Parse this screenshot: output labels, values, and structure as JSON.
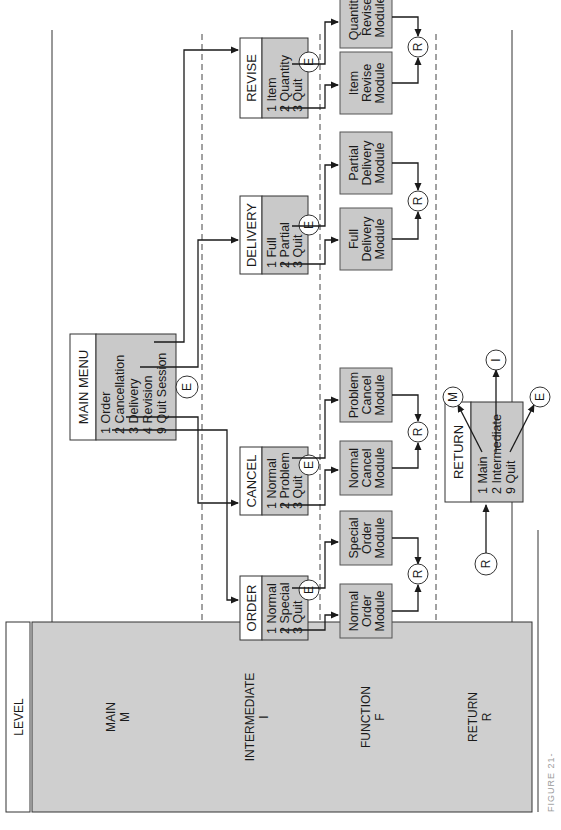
{
  "figure": {
    "caption_partial": "FIGURE 21-",
    "orientation": "rotated 90° counter-clockwise",
    "colors": {
      "box_fill": "#c9c9c9",
      "level_fill": "#cfcfcf",
      "line": "#1a1a1a",
      "dashed": "#444444",
      "background": "#ffffff"
    }
  },
  "levels": {
    "header": "LEVEL",
    "rows": [
      {
        "name": "MAIN",
        "code": "M"
      },
      {
        "name": "INTERMEDIATE",
        "code": "I"
      },
      {
        "name": "FUNCTION",
        "code": "F"
      },
      {
        "name": "RETURN",
        "code": "R"
      }
    ]
  },
  "main_menu": {
    "title": "MAIN MENU",
    "items": [
      "1 Order",
      "2 Cancellation",
      "3 Delivery",
      "4 Revision",
      "9 Quit Session"
    ],
    "exit": "E"
  },
  "intermediate_menus": [
    {
      "title": "ORDER",
      "items": [
        "1 Normal",
        "2 Special",
        "3 Quit"
      ],
      "exit": "E",
      "modules": [
        "Normal Order Module",
        "Special Order Module"
      ]
    },
    {
      "title": "CANCEL",
      "items": [
        "1 Normal",
        "2 Problem",
        "3 Quit"
      ],
      "exit": "E",
      "modules": [
        "Problem Cancel Module",
        "Normal Cancel Module"
      ]
    },
    {
      "title": "DELIVERY",
      "items": [
        "1 Full",
        "2 Partial",
        "3 Quit"
      ],
      "exit": "E",
      "modules": [
        "Full Delivery Module",
        "Partial Delivery Module"
      ]
    },
    {
      "title": "REVISE",
      "items": [
        "1 Item",
        "2 Quantity",
        "3 Quit"
      ],
      "exit": "E",
      "modules": [
        "Item Revise Module",
        "Quantity Revise Module"
      ]
    }
  ],
  "modules_split": {
    "order": [
      [
        "Normal",
        "Order",
        "Module"
      ],
      [
        "Special",
        "Order",
        "Module"
      ]
    ],
    "cancel": [
      [
        "Normal",
        "Cancel",
        "Module"
      ],
      [
        "Problem",
        "Cancel",
        "Module"
      ]
    ],
    "delivery": [
      [
        "Full",
        "Delivery",
        "Module"
      ],
      [
        "Partial",
        "Delivery",
        "Module"
      ]
    ],
    "revise": [
      [
        "Item",
        "Revise",
        "Module"
      ],
      [
        "Quantity",
        "Revise",
        "Module"
      ]
    ]
  },
  "return_connector": "R",
  "return_menu": {
    "title": "RETURN",
    "items": [
      "1 Main",
      "2 Intermediate",
      "9 Quit"
    ],
    "targets": [
      "M",
      "I",
      "E"
    ],
    "entry": "R"
  }
}
